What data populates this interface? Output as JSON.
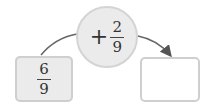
{
  "operation": {
    "operator": "+",
    "numerator": "2",
    "denominator": "9"
  },
  "start_value": {
    "numerator": "6",
    "denominator": "9"
  },
  "result_value": {
    "content": ""
  },
  "colors": {
    "shape_fill": "#ebebeb",
    "shape_border": "#d4d4d4",
    "arrow": "#555555"
  }
}
